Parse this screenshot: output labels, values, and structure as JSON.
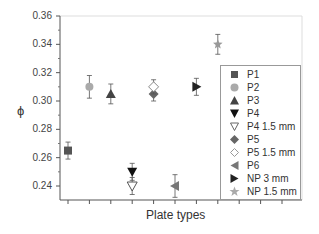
{
  "chart_data": {
    "type": "scatter",
    "title": "",
    "xlabel": "Plate types",
    "ylabel": "ϕ",
    "ylim": [
      0.23,
      0.36
    ],
    "yticks": [
      0.24,
      0.26,
      0.28,
      0.3,
      0.32,
      0.34,
      0.36
    ],
    "ytick_labels": [
      "0.24",
      "0.26",
      "0.28",
      "0.30",
      "0.32",
      "0.34",
      "0.36"
    ],
    "grid": false,
    "legend_position": "lower right (inside)",
    "series": [
      {
        "name": "P1",
        "x": 1,
        "value": 0.265,
        "error": 0.006,
        "marker": "square-filled",
        "color": "#555555"
      },
      {
        "name": "P2",
        "x": 2,
        "value": 0.31,
        "error": 0.008,
        "marker": "circle-filled",
        "color": "#aaaaaa"
      },
      {
        "name": "P3",
        "x": 3,
        "value": 0.305,
        "error": 0.007,
        "marker": "triangle-up-filled",
        "color": "#444444"
      },
      {
        "name": "P4",
        "x": 4,
        "value": 0.25,
        "error": 0.006,
        "marker": "triangle-down-filled",
        "color": "#111111"
      },
      {
        "name": "P4 1.5 mm",
        "x": 4,
        "value": 0.24,
        "error": 0.006,
        "marker": "triangle-down-open",
        "color": "#555555"
      },
      {
        "name": "P5",
        "x": 5,
        "value": 0.305,
        "error": 0.005,
        "marker": "diamond-filled",
        "color": "#666666"
      },
      {
        "name": "P5 1.5 mm",
        "x": 5,
        "value": 0.31,
        "error": 0.005,
        "marker": "diamond-open",
        "color": "#888888"
      },
      {
        "name": "P6",
        "x": 6,
        "value": 0.24,
        "error": 0.008,
        "marker": "triangle-left-filled",
        "color": "#777777"
      },
      {
        "name": "NP 3 mm",
        "x": 7,
        "value": 0.31,
        "error": 0.006,
        "marker": "triangle-right-filled",
        "color": "#222222"
      },
      {
        "name": "NP 1.5 mm",
        "x": 8,
        "value": 0.34,
        "error": 0.007,
        "marker": "star-filled",
        "color": "#999999"
      }
    ]
  },
  "legend": {
    "items": [
      {
        "label": "P1"
      },
      {
        "label": "P2"
      },
      {
        "label": "P3"
      },
      {
        "label": "P4"
      },
      {
        "label": "P4 1.5 mm"
      },
      {
        "label": "P5"
      },
      {
        "label": "P5 1.5 mm"
      },
      {
        "label": "P6"
      },
      {
        "label": "NP 3 mm"
      },
      {
        "label": "NP 1.5 mm"
      }
    ]
  }
}
